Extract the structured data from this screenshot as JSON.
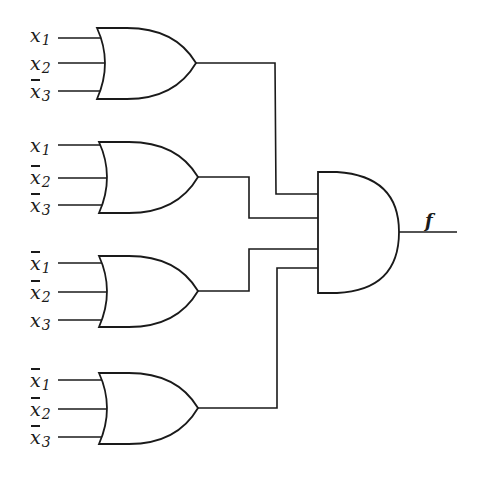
{
  "diagram": {
    "type": "logic-circuit",
    "output_label": "f",
    "colors": {
      "line": "#1a1a1a",
      "background": "#ffffff"
    },
    "or_gates": [
      {
        "id": "or1",
        "inputs": [
          {
            "var": "x",
            "sub": "1",
            "negated": false
          },
          {
            "var": "x",
            "sub": "2",
            "negated": false
          },
          {
            "var": "x",
            "sub": "3",
            "negated": true
          }
        ]
      },
      {
        "id": "or2",
        "inputs": [
          {
            "var": "x",
            "sub": "1",
            "negated": false
          },
          {
            "var": "x",
            "sub": "2",
            "negated": true
          },
          {
            "var": "x",
            "sub": "3",
            "negated": true
          }
        ]
      },
      {
        "id": "or3",
        "inputs": [
          {
            "var": "x",
            "sub": "1",
            "negated": true
          },
          {
            "var": "x",
            "sub": "2",
            "negated": true
          },
          {
            "var": "x",
            "sub": "3",
            "negated": false
          }
        ]
      },
      {
        "id": "or4",
        "inputs": [
          {
            "var": "x",
            "sub": "1",
            "negated": true
          },
          {
            "var": "x",
            "sub": "2",
            "negated": true
          },
          {
            "var": "x",
            "sub": "3",
            "negated": true
          }
        ]
      }
    ],
    "and_gate": {
      "id": "and1",
      "inputs": [
        "or1",
        "or2",
        "or3",
        "or4"
      ],
      "output": "f"
    }
  }
}
